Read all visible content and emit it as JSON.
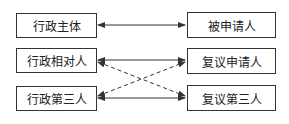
{
  "left_boxes": [
    {
      "label": "行政主体"
    },
    {
      "label": "行政相对人"
    },
    {
      "label": "行政第三人"
    }
  ],
  "right_boxes": [
    {
      "label": "被申请人"
    },
    {
      "label": "复议申请人"
    },
    {
      "label": "复议第三人"
    }
  ],
  "connections": [
    {
      "from": "行政主体",
      "to": "被申请人",
      "style": "solid",
      "direction": "both"
    },
    {
      "from": "行政相对人",
      "to": "复议申请人",
      "style": "solid",
      "direction": "both"
    },
    {
      "from": "行政第三人",
      "to": "复议第三人",
      "style": "solid",
      "direction": "both"
    },
    {
      "from": "行政相对人",
      "to": "复议第三人",
      "style": "dashed",
      "direction": "both"
    },
    {
      "from": "行政第三人",
      "to": "复议申请人",
      "style": "dashed",
      "direction": "both"
    }
  ],
  "colors": {
    "line": "#333333"
  }
}
